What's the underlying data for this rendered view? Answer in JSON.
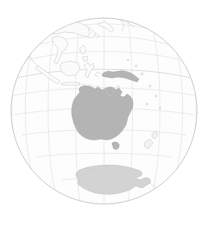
{
  "figure": {
    "type": "map",
    "projection": "orthographic",
    "canvas_width": 210,
    "canvas_height": 226,
    "background_color": "#ffffff"
  },
  "globe": {
    "center_x": 104,
    "center_y": 111,
    "radius": 93,
    "center_longitude": 134,
    "center_latitude": -25,
    "ocean_color": "#fdfdfd",
    "outline_color": "#d6d6d6"
  },
  "graticule": {
    "spacing_degrees": 15,
    "line_color": "#dedede",
    "equator_color": "#d4d4d4",
    "meridians": [
      0,
      15,
      30,
      45,
      60,
      75,
      90,
      105,
      120,
      135,
      150,
      165,
      180,
      195,
      210,
      225,
      240,
      255,
      270,
      285,
      300,
      315,
      330,
      345
    ],
    "parallels": [
      -75,
      -60,
      -45,
      -30,
      -15,
      0,
      15,
      30,
      45,
      60,
      75
    ],
    "visible": true
  },
  "landmasses": [
    {
      "name": "australia",
      "fill": "#b4b4b4",
      "emphasis": "major"
    },
    {
      "name": "tasmania",
      "fill": "#b4b4b4",
      "emphasis": "major"
    },
    {
      "name": "new-guinea",
      "fill": "#b4b4b4",
      "emphasis": "major"
    },
    {
      "name": "antarctica",
      "fill": "#d3d3d3",
      "emphasis": "polar"
    },
    {
      "name": "new-zealand",
      "fill": "#f2f2f2",
      "emphasis": "island"
    },
    {
      "name": "indonesia",
      "fill": "#fbfbfb",
      "emphasis": "faint"
    },
    {
      "name": "borneo",
      "fill": "#fbfbfb",
      "emphasis": "faint"
    },
    {
      "name": "sumatra",
      "fill": "#fbfbfb",
      "emphasis": "faint"
    },
    {
      "name": "java",
      "fill": "#fbfbfb",
      "emphasis": "faint"
    },
    {
      "name": "sulawesi",
      "fill": "#fbfbfb",
      "emphasis": "faint"
    },
    {
      "name": "philippines",
      "fill": "#fbfbfb",
      "emphasis": "faint"
    },
    {
      "name": "southeast-asia",
      "fill": "#fbfbfb",
      "emphasis": "faint"
    },
    {
      "name": "east-asia",
      "fill": "#fbfbfb",
      "emphasis": "faint"
    },
    {
      "name": "japan",
      "fill": "#fbfbfb",
      "emphasis": "faint"
    },
    {
      "name": "pacific-islands",
      "fill": "#f2f2f2",
      "emphasis": "island"
    }
  ],
  "labels": {
    "none_visible": ""
  }
}
